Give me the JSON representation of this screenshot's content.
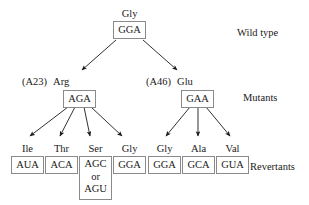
{
  "diagram": {
    "background_color": "#ffffff",
    "text_color": "#1a1a1a",
    "box_border_color": "#8a8a8a",
    "arrow_color": "#1a1a1a"
  },
  "stage_labels": {
    "wild_type": "Wild type",
    "mutants": "Mutants",
    "revertants": "Revertants"
  },
  "wild_type": {
    "amino_acid": "Gly",
    "codon": "GGA"
  },
  "mutants": [
    {
      "allele": "(A23)",
      "amino_acid": "Arg",
      "codon": "AGA"
    },
    {
      "allele": "(A46)",
      "amino_acid": "Glu",
      "codon": "GAA"
    }
  ],
  "revertants_left": [
    {
      "amino_acid": "Ile",
      "codon": "AUA",
      "alt_codon": "",
      "conjunction": ""
    },
    {
      "amino_acid": "Thr",
      "codon": "ACA",
      "alt_codon": "",
      "conjunction": ""
    },
    {
      "amino_acid": "Ser",
      "codon": "AGC",
      "alt_codon": "AGU",
      "conjunction": "or"
    },
    {
      "amino_acid": "Gly",
      "codon": "GGA",
      "alt_codon": "",
      "conjunction": ""
    }
  ],
  "revertants_right": [
    {
      "amino_acid": "Gly",
      "codon": "GGA",
      "alt_codon": "",
      "conjunction": ""
    },
    {
      "amino_acid": "Ala",
      "codon": "GCA",
      "alt_codon": "",
      "conjunction": ""
    },
    {
      "amino_acid": "Val",
      "codon": "GUA",
      "alt_codon": "",
      "conjunction": ""
    }
  ]
}
